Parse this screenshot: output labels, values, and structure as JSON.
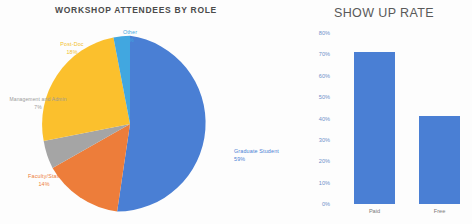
{
  "pie_chart": {
    "title": "WORKSHOP ATTENDEES BY ROLE",
    "labels": {
      "other": {
        "name": "Other",
        "pct": "3%"
      },
      "postdoc": {
        "name": "Post-Doc",
        "pct": "18%"
      },
      "admin": {
        "name": "Management and Admin",
        "pct": "7%"
      },
      "faculty": {
        "name": "Faculty/Staff",
        "pct": "14%"
      },
      "grad": {
        "name": "Graduate Student",
        "pct": "59%"
      }
    }
  },
  "bar_chart": {
    "title": "SHOW UP RATE"
  },
  "chart_data": [
    {
      "type": "pie",
      "title": "WORKSHOP ATTENDEES BY ROLE",
      "categories": [
        "Graduate Student",
        "Faculty/Staff",
        "Management and Admin",
        "Post-Doc",
        "Other"
      ],
      "values": [
        59,
        14,
        7,
        18,
        3
      ],
      "value_labels": [
        "59%",
        "14%",
        "7%",
        "18%",
        "3%"
      ],
      "colors": [
        "#4a7fd4",
        "#ed7d3a",
        "#a5a5a5",
        "#fbc02d",
        "#41a7e0"
      ],
      "legend": "none",
      "labels_position": "outside"
    },
    {
      "type": "bar",
      "title": "SHOW UP RATE",
      "categories": [
        "Paid",
        "Free"
      ],
      "values": [
        71,
        41
      ],
      "xlabel": "",
      "ylabel": "",
      "ylim": [
        0,
        80
      ],
      "ytick_labels": [
        "80%",
        "70%",
        "60%",
        "50%",
        "40%",
        "30%",
        "20%",
        "10%",
        "0%"
      ],
      "ytick_values": [
        80,
        70,
        60,
        50,
        40,
        30,
        20,
        10,
        0
      ],
      "grid": false,
      "legend": "none",
      "bar_color": "#4a7fd4"
    }
  ]
}
